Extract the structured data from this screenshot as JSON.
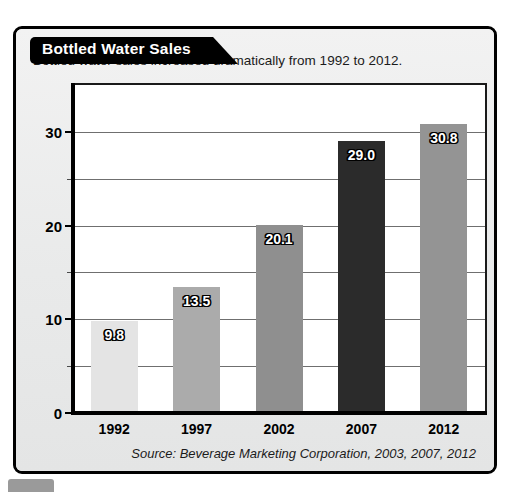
{
  "card": {
    "title": "Bottled Water Sales",
    "subtitle": "Bottled water sales increased dramatically from 1992 to 2012.",
    "source": "Source: Beverage Marketing Corporation, 2003, 2007, 2012"
  },
  "chart_data": {
    "type": "bar",
    "title": "Bottled Water Sales",
    "subtitle": "Bottled water sales increased dramatically from 1992 to 2012.",
    "xlabel": "",
    "ylabel": "GALLONS PER PERSON",
    "categories": [
      "1992",
      "1997",
      "2002",
      "2007",
      "2012"
    ],
    "values": [
      9.8,
      13.5,
      20.1,
      29.0,
      30.8
    ],
    "value_labels": [
      "9.8",
      "13.5",
      "20.1",
      "29.0",
      "30.8"
    ],
    "bar_colors": [
      "#e4e4e4",
      "#ababab",
      "#8f8f8f",
      "#2b2b2b",
      "#949494"
    ],
    "ylim": [
      0,
      35
    ],
    "ytick_values": [
      0,
      10,
      20,
      30
    ],
    "ytick_labels": [
      "0",
      "10",
      "20",
      "30"
    ],
    "minor_gridline_values": [
      5,
      15,
      25
    ],
    "major_gridline_values": [
      10,
      20,
      30
    ],
    "grid": true,
    "legend": "none",
    "source": "Source: Beverage Marketing Corporation, 2003, 2007, 2012"
  },
  "colors": {
    "card_background": "#eceded",
    "plot_background": "#ffffff",
    "frame": "#1a1a1a",
    "banner": "#000000",
    "banner_text": "#ffffff",
    "gridline": "#6f6f6f",
    "value_label_text": "#ffffff",
    "value_label_outline": "#000000"
  }
}
